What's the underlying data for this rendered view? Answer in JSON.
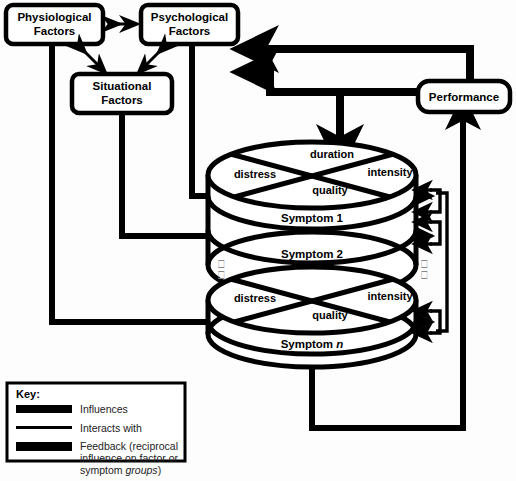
{
  "diagram": {
    "boxes": [
      {
        "id": "physiological",
        "label_line1": "Physiological",
        "label_line2": "Factors"
      },
      {
        "id": "psychological",
        "label_line1": "Psychological",
        "label_line2": "Factors"
      },
      {
        "id": "situational",
        "label_line1": "Situational",
        "label_line2": "Factors"
      },
      {
        "id": "performance",
        "label_line1": "Performance",
        "label_line2": ""
      }
    ],
    "cylinders": [
      {
        "id": "upper-stack",
        "sectors": {
          "top": "duration",
          "left": "distress",
          "right": "intensity",
          "bottom": "quality"
        },
        "layers": [
          "Symptom 1",
          "Symptom 2"
        ]
      },
      {
        "id": "lower-stack",
        "sectors": {
          "top": "",
          "left": "distress",
          "right": "intensity",
          "bottom": "quality"
        },
        "layers": [
          "Symptom n"
        ]
      }
    ],
    "ellipsis_glyph": "⎕",
    "key": {
      "title": "Key:",
      "entries": [
        {
          "style": "thick",
          "label": "Influences"
        },
        {
          "style": "thin",
          "label": "Interacts with"
        },
        {
          "style": "thick",
          "label_part1": "Feedback (reciprocal",
          "label_part2": "influence on factor or",
          "label_part3": "symptom ",
          "label_part3_italic": "groups",
          "label_part4": ")"
        }
      ]
    },
    "colors": {
      "ink": "#000000",
      "background": "#fdfdfd",
      "tofu": "#888888"
    }
  }
}
